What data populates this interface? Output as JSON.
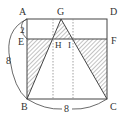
{
  "figure": {
    "type": "geometry",
    "shape": "square ABCD with rectangle strip AEFD and triangle GBC",
    "colors": {
      "stroke": "#444444",
      "hatch": "#555555",
      "dotted": "#777777",
      "background": "#ffffff"
    },
    "points": {
      "A": {
        "label": "A",
        "x": 27,
        "y": 19
      },
      "D": {
        "label": "D",
        "x": 107,
        "y": 19
      },
      "B": {
        "label": "B",
        "x": 27,
        "y": 99
      },
      "C": {
        "label": "C",
        "x": 107,
        "y": 99
      },
      "E": {
        "label": "E",
        "x": 27,
        "y": 39
      },
      "F": {
        "label": "F",
        "x": 107,
        "y": 39
      },
      "G": {
        "label": "G",
        "x": 61,
        "y": 19
      },
      "H": {
        "label": "H",
        "x": 53,
        "y": 39
      },
      "I": {
        "label": "I",
        "x": 73,
        "y": 39
      }
    },
    "measurements": {
      "AE": "2",
      "AB": "8",
      "BC": "8"
    }
  }
}
